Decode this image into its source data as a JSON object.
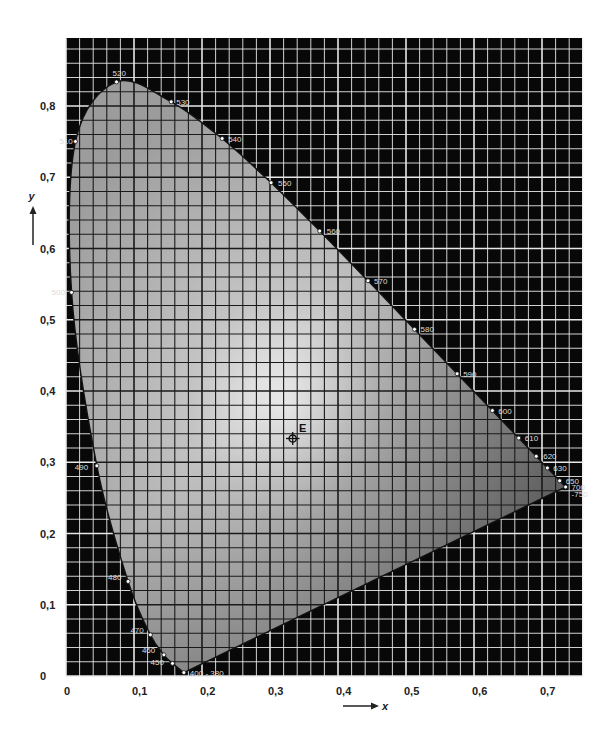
{
  "chart_data": {
    "type": "scatter",
    "xlabel": "x",
    "ylabel": "y",
    "xlim": [
      0,
      0.76
    ],
    "ylim": [
      0,
      0.895
    ],
    "grid": true,
    "grid_major_step": 0.1,
    "grid_minor_step": 0.02,
    "x_ticks": [
      "0",
      "0,1",
      "0,2",
      "0,3",
      "0,4",
      "0,5",
      "0,6",
      "0,7"
    ],
    "y_ticks": [
      "0",
      "0,1",
      "0,2",
      "0,3",
      "0,4",
      "0,5",
      "0,6",
      "0,7",
      "0,8"
    ],
    "spectral_locus": [
      {
        "nm": "380",
        "x": 0.1741,
        "y": 0.005
      },
      {
        "nm": "400",
        "x": 0.1733,
        "y": 0.0048
      },
      {
        "nm": "450",
        "x": 0.1566,
        "y": 0.0177
      },
      {
        "nm": "460",
        "x": 0.144,
        "y": 0.0297
      },
      {
        "nm": "470",
        "x": 0.1241,
        "y": 0.0578
      },
      {
        "nm": "480",
        "x": 0.0913,
        "y": 0.1327
      },
      {
        "nm": "490",
        "x": 0.0454,
        "y": 0.295
      },
      {
        "nm": "500",
        "x": 0.0082,
        "y": 0.5384
      },
      {
        "nm": "510",
        "x": 0.0139,
        "y": 0.7502
      },
      {
        "nm": "520",
        "x": 0.0743,
        "y": 0.8338
      },
      {
        "nm": "530",
        "x": 0.1547,
        "y": 0.8059
      },
      {
        "nm": "540",
        "x": 0.2296,
        "y": 0.7543
      },
      {
        "nm": "550",
        "x": 0.3016,
        "y": 0.6923
      },
      {
        "nm": "560",
        "x": 0.3731,
        "y": 0.6245
      },
      {
        "nm": "570",
        "x": 0.4441,
        "y": 0.5547
      },
      {
        "nm": "580",
        "x": 0.5125,
        "y": 0.4866
      },
      {
        "nm": "590",
        "x": 0.5752,
        "y": 0.4242
      },
      {
        "nm": "600",
        "x": 0.627,
        "y": 0.3725
      },
      {
        "nm": "610",
        "x": 0.6658,
        "y": 0.334
      },
      {
        "nm": "620",
        "x": 0.6915,
        "y": 0.3083
      },
      {
        "nm": "630",
        "x": 0.7079,
        "y": 0.292
      },
      {
        "nm": "650",
        "x": 0.726,
        "y": 0.274
      },
      {
        "nm": "700",
        "x": 0.7347,
        "y": 0.2653
      },
      {
        "nm": "750",
        "x": 0.7347,
        "y": 0.2653
      }
    ],
    "wavelength_labels": [
      "400 - 380",
      "450",
      "460",
      "470",
      "480",
      "490",
      "500",
      "510",
      "520",
      "530",
      "540",
      "550",
      "560",
      "570",
      "580",
      "590",
      "600",
      "610",
      "620",
      "630",
      "650",
      "700",
      "750"
    ],
    "annotations": [
      {
        "label": "E",
        "x": 0.3333,
        "y": 0.3333,
        "description": "equal-energy white point"
      }
    ]
  },
  "labels": {
    "x_axis": "x",
    "y_axis": "y",
    "white_point": "E",
    "purple_line_end": "400 - 380"
  }
}
